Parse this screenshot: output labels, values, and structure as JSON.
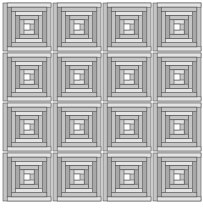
{
  "quilt": {
    "pattern": "log-cabin",
    "rows": 4,
    "cols": 4,
    "block_size": 50,
    "offset_x": 2,
    "offset_y": 2,
    "colors": {
      "light": "#e4e4e4",
      "medium": "#c4c4c4",
      "dark": "#a8a8a8",
      "center": "#ffffff",
      "line": "#555555"
    }
  }
}
